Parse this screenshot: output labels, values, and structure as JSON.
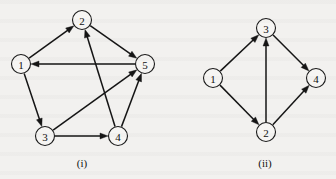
{
  "figure": {
    "background_color": "#f2f1ef",
    "ink_color": "#151515",
    "node_fill_color": "#f6f5f3",
    "node_radius": 9.5,
    "arrow_length": 8,
    "arrow_half_width": 3
  },
  "graphs": [
    {
      "id": "graph-i",
      "caption": "(i)",
      "caption_x": 82,
      "caption_y": 163,
      "nodes": [
        {
          "label": "1",
          "x": 21,
          "y": 64
        },
        {
          "label": "2",
          "x": 82,
          "y": 20
        },
        {
          "label": "3",
          "x": 45,
          "y": 136
        },
        {
          "label": "4",
          "x": 118,
          "y": 136
        },
        {
          "label": "5",
          "x": 145,
          "y": 64
        }
      ],
      "edges": [
        {
          "from": "1",
          "to": "2"
        },
        {
          "from": "2",
          "to": "5"
        },
        {
          "from": "5",
          "to": "1"
        },
        {
          "from": "1",
          "to": "3"
        },
        {
          "from": "3",
          "to": "4"
        },
        {
          "from": "3",
          "to": "5"
        },
        {
          "from": "4",
          "to": "5"
        },
        {
          "from": "4",
          "to": "2"
        }
      ]
    },
    {
      "id": "graph-ii",
      "caption": "(ii)",
      "caption_x": 265,
      "caption_y": 163,
      "nodes": [
        {
          "label": "1",
          "x": 213,
          "y": 78
        },
        {
          "label": "3",
          "x": 266,
          "y": 28
        },
        {
          "label": "2",
          "x": 266,
          "y": 132
        },
        {
          "label": "4",
          "x": 316,
          "y": 78
        }
      ],
      "edges": [
        {
          "from": "1",
          "to": "3"
        },
        {
          "from": "1",
          "to": "2"
        },
        {
          "from": "2",
          "to": "3"
        },
        {
          "from": "2",
          "to": "4"
        },
        {
          "from": "3",
          "to": "4"
        }
      ]
    }
  ]
}
